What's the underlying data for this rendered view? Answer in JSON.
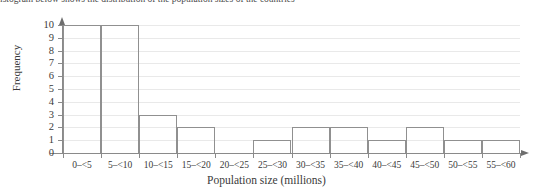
{
  "top_fragment": "istogram below shows the distribution of the population sizes of the countries",
  "chart_data": {
    "type": "bar",
    "title": "",
    "xlabel": "Population size (millions)",
    "ylabel": "Frequency",
    "categories": [
      "0–<5",
      "5–<10",
      "10–<15",
      "15–<20",
      "20–<25",
      "25–<30",
      "30–<35",
      "35–<40",
      "40–<45",
      "45–<50",
      "50–<55",
      "55–<60"
    ],
    "values": [
      10,
      10,
      3,
      2,
      0,
      1,
      2,
      2,
      1,
      2,
      1,
      1
    ],
    "ylim": [
      0,
      10
    ],
    "ytick_labels": [
      "0",
      "1",
      "2",
      "3",
      "4",
      "5",
      "6",
      "7",
      "8",
      "9",
      "10"
    ],
    "xtick_boundaries": [
      "0",
      "5",
      "10",
      "15",
      "20",
      "25",
      "30",
      "35",
      "40",
      "45",
      "50",
      "55",
      "60"
    ],
    "grid": true,
    "legend": "none",
    "bin_width": 5,
    "bar_edge_color": "#909090",
    "bar_fill_color": "none",
    "grid_color": "#e9e9e9",
    "axis_color": "#8a8a8a"
  }
}
